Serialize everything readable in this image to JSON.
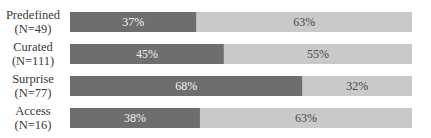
{
  "chart_data": {
    "type": "bar",
    "orientation": "horizontal",
    "stacked": true,
    "normalized_percent": true,
    "title": "",
    "xlabel": "",
    "ylabel": "",
    "xlim": [
      0,
      100
    ],
    "grid": false,
    "legend": "none",
    "categories": [
      {
        "name": "Predefined",
        "n_label": "(N=49)"
      },
      {
        "name": "Curated",
        "n_label": "(N=111)"
      },
      {
        "name": "Surprise",
        "n_label": "(N=77)"
      },
      {
        "name": "Access",
        "n_label": "(N=16)"
      }
    ],
    "series": [
      {
        "name": "segment-1",
        "color": "#6e6e6e",
        "label_color": "#f2f2f2",
        "values": [
          37,
          45,
          68,
          38
        ],
        "labels": [
          "37%",
          "45%",
          "68%",
          "38%"
        ]
      },
      {
        "name": "segment-2",
        "color": "#c9c9c9",
        "label_color": "#4a4a4a",
        "values": [
          63,
          55,
          32,
          63
        ],
        "labels": [
          "63%",
          "55%",
          "32%",
          "63%"
        ]
      }
    ]
  }
}
